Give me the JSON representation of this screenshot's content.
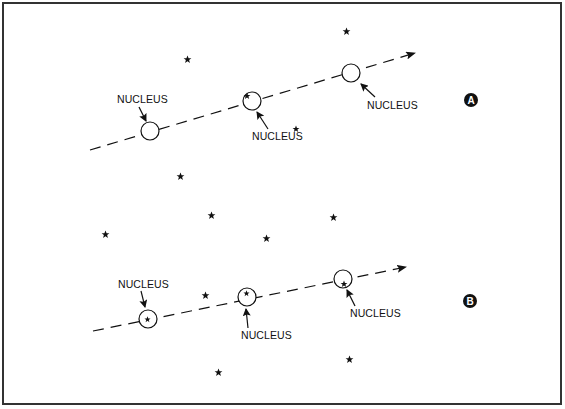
{
  "figure": {
    "colors": {
      "ink": "#111111",
      "paper": "#ffffff",
      "frame": "#333333"
    }
  },
  "panels": [
    {
      "id": "A",
      "badge": "A",
      "label_text": "NUCLEUS",
      "nuclei": [
        {
          "label": "NUCLEUS",
          "star_inside": false
        },
        {
          "label": "NUCLEUS",
          "star_inside": true
        },
        {
          "label": "NUCLEUS",
          "star_inside": false
        }
      ]
    },
    {
      "id": "B",
      "badge": "B",
      "label_text": "NUCLEUS",
      "nuclei": [
        {
          "label": "NUCLEUS",
          "star_inside": true
        },
        {
          "label": "NUCLEUS",
          "star_inside": true
        },
        {
          "label": "NUCLEUS",
          "star_inside": true
        }
      ]
    }
  ]
}
